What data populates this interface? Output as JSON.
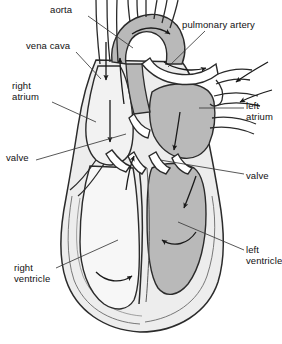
{
  "diagram": {
    "view": "coronal section, anterior view",
    "style": "black-and-white line drawing with gray shading",
    "background_color": "#ffffff",
    "line_color": "#2b2b2b",
    "colors": {
      "oxygenated_chamber_fill": "#b9b9b9",
      "deoxygenated_chamber_fill": "#f2f2f2",
      "myocardium_fill": "#ededed",
      "lumen_fill": "#ffffff",
      "outline": "#2b2b2b",
      "arrow": "#1a1a1a",
      "leader_line": "#3a3a3a",
      "text": "#111111"
    },
    "labels": [
      {
        "id": "aorta",
        "text": "aorta",
        "x": 50,
        "y": 4,
        "align": "left",
        "leader": {
          "x1": 88,
          "y1": 16,
          "x2": 133,
          "y2": 48
        }
      },
      {
        "id": "pulmonary-artery",
        "text": "pulmonary artery",
        "x": 182,
        "y": 19,
        "align": "left",
        "leader": {
          "x1": 205,
          "y1": 31,
          "x2": 168,
          "y2": 67
        }
      },
      {
        "id": "vena-cava",
        "text": "vena cava",
        "x": 26,
        "y": 40,
        "align": "left",
        "leader": {
          "x1": 76,
          "y1": 52,
          "x2": 101,
          "y2": 79
        }
      },
      {
        "id": "right-atrium",
        "text": "right\natrium",
        "x": 12,
        "y": 80,
        "align": "left",
        "leader": {
          "x1": 52,
          "y1": 102,
          "x2": 96,
          "y2": 122
        }
      },
      {
        "id": "left-atrium",
        "text": "left\natrium",
        "x": 246,
        "y": 100,
        "align": "left",
        "leader": {
          "x1": 244,
          "y1": 108,
          "x2": 199,
          "y2": 108
        }
      },
      {
        "id": "valve-left",
        "text": "valve",
        "x": 6,
        "y": 152,
        "align": "left",
        "leader": {
          "x1": 36,
          "y1": 160,
          "x2": 126,
          "y2": 134
        }
      },
      {
        "id": "valve-right",
        "text": "valve",
        "x": 246,
        "y": 170,
        "align": "left",
        "leader": {
          "x1": 244,
          "y1": 174,
          "x2": 160,
          "y2": 160
        }
      },
      {
        "id": "left-ventricle",
        "text": "left\nventricle",
        "x": 246,
        "y": 244,
        "align": "left",
        "leader": {
          "x1": 244,
          "y1": 250,
          "x2": 178,
          "y2": 222
        }
      },
      {
        "id": "right-ventricle",
        "text": "right\nventricle",
        "x": 14,
        "y": 262,
        "align": "left",
        "leader": {
          "x1": 56,
          "y1": 268,
          "x2": 118,
          "y2": 240
        }
      }
    ],
    "structures": [
      {
        "id": "aortic-arch",
        "name": "aorta",
        "shading": "oxygenated"
      },
      {
        "id": "brachiocephalic-branches",
        "name": "aortic arch branches",
        "count": 3,
        "shading": "lumen"
      },
      {
        "id": "superior-vena-cava",
        "name": "vena cava",
        "shading": "lumen"
      },
      {
        "id": "pulmonary-artery",
        "name": "pulmonary artery",
        "shading": "lumen"
      },
      {
        "id": "pulmonary-veins",
        "name": "pulmonary veins",
        "count": 2,
        "shading": "lumen"
      },
      {
        "id": "right-atrium",
        "name": "right atrium",
        "shading": "deoxygenated"
      },
      {
        "id": "left-atrium",
        "name": "left atrium",
        "shading": "oxygenated"
      },
      {
        "id": "right-ventricle",
        "name": "right ventricle",
        "shading": "deoxygenated"
      },
      {
        "id": "left-ventricle",
        "name": "left ventricle",
        "shading": "oxygenated"
      },
      {
        "id": "interventricular-septum",
        "name": "septum",
        "shading": "myocardium"
      },
      {
        "id": "tricuspid-valve",
        "name": "valve",
        "shading": "lumen"
      },
      {
        "id": "mitral-valve",
        "name": "valve",
        "shading": "lumen"
      }
    ],
    "flow_arrows": [
      {
        "id": "arrow-svc-down",
        "region": "vena cava",
        "direction": "down"
      },
      {
        "id": "arrow-ra-down",
        "region": "right atrium",
        "direction": "down"
      },
      {
        "id": "arrow-tricuspid-up",
        "region": "tricuspid valve",
        "direction": "up-right"
      },
      {
        "id": "arrow-rv-curve",
        "region": "right ventricle",
        "direction": "curved-up"
      },
      {
        "id": "arrow-pa-out",
        "region": "pulmonary artery",
        "direction": "right"
      },
      {
        "id": "arrow-pv-in-upper",
        "region": "pulmonary vein",
        "direction": "down-left"
      },
      {
        "id": "arrow-pv-in-lower",
        "region": "pulmonary vein",
        "direction": "down-left"
      },
      {
        "id": "arrow-la-down",
        "region": "left atrium",
        "direction": "down"
      },
      {
        "id": "arrow-mitral-down",
        "region": "mitral valve",
        "direction": "down-left"
      },
      {
        "id": "arrow-lv-curve",
        "region": "left ventricle",
        "direction": "curved-left"
      },
      {
        "id": "arrow-aorta-up",
        "region": "aorta ascending",
        "direction": "up"
      },
      {
        "id": "arrow-arch-right",
        "region": "aortic arch",
        "direction": "right"
      }
    ]
  }
}
